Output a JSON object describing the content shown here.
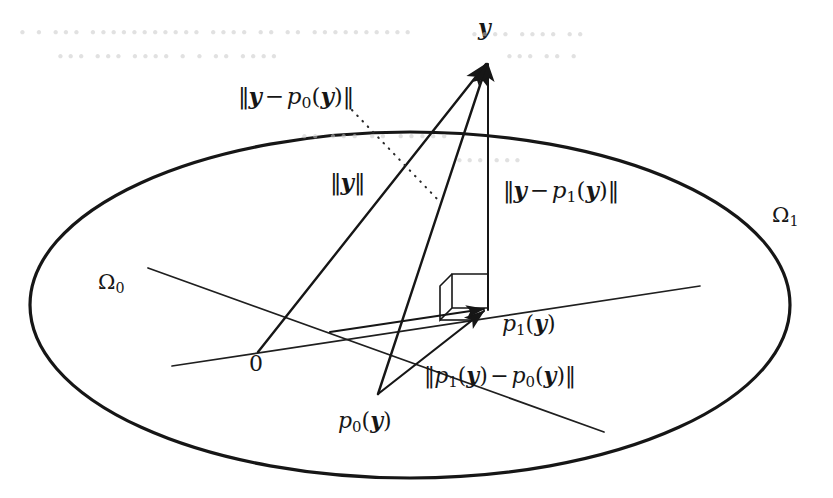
{
  "figure": {
    "name": "orthogonal-projection-diagram",
    "background_color": "#ffffff",
    "ink_color": "#161616"
  },
  "labels": {
    "apex_y": "y",
    "norm_y_minus_p0": "‖y − p₀(y)‖",
    "norm_y": "‖y‖",
    "norm_y_minus_p1": "‖y − p₁(y)‖",
    "omega_1": "Ω₁",
    "omega_0": "Ω₀",
    "p1_of_y": "p₁(y)",
    "norm_p1_minus_p0": "‖p₁(y) − p₀(y)‖",
    "origin": "0",
    "p0_of_y": "p₀(y)"
  },
  "label_parts": {
    "y_var": "y",
    "p_fn": "p",
    "sub_zero": "0",
    "sub_one": "1",
    "minus": "−",
    "dbl_bar": "‖",
    "open_paren": "(",
    "close_paren": ")",
    "omega": "Ω",
    "zero": "0"
  },
  "geometry": {
    "ellipse_omega1": {
      "cx": 410,
      "cy": 305,
      "rx": 380,
      "ry": 173,
      "stroke_width": 3.2
    },
    "line_omega0": {
      "x1": 148,
      "y1": 268,
      "x2": 604,
      "y2": 432,
      "stroke_width": 1.6
    },
    "line_omega0_axis": {
      "x1": 172,
      "y1": 366,
      "x2": 700,
      "y2": 288,
      "stroke_width": 1.6
    },
    "point_origin": {
      "x": 258,
      "y": 352
    },
    "point_apex_y": {
      "x": 488,
      "y": 58
    },
    "point_p1y": {
      "x": 488,
      "y": 308
    },
    "point_p0y": {
      "x": 378,
      "y": 394
    },
    "vector_norm_y": {
      "from": "origin",
      "to": "apex_y"
    },
    "vector_y_minus_p0": {
      "from": "p0y",
      "to": "apex_y"
    },
    "vector_y_minus_p1": {
      "from": "p1y",
      "to": "apex_y"
    },
    "vector_p1_minus_p0": {
      "from": "p0y",
      "to": "p1y"
    },
    "right_angle_marker": {
      "at": "p1y",
      "style": "3d-parallelogram"
    },
    "leader_dotted": {
      "x1": 352,
      "y1": 112,
      "x2": 436,
      "y2": 196
    }
  },
  "ghost_showthrough": {
    "line_1": "• • •••  ••••••••••• •••• •• •• ••••••••••",
    "line_2": "••• ••• ••••  • • •• ••••",
    "line_3": "•••• ••••  ••",
    "line_4": "••• ••  •",
    "line_5": "••  ••• ••  •••••",
    "line_6": "••• •••"
  }
}
